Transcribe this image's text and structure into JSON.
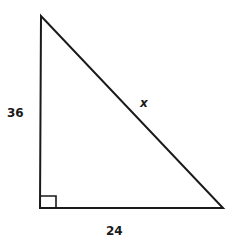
{
  "figure": {
    "type": "right-triangle",
    "labels": {
      "vertical_leg": "36",
      "horizontal_leg": "24",
      "hypotenuse": "x"
    },
    "right_angle_marker": true,
    "stroke_color": "#1a1a1a",
    "background": "#ffffff"
  }
}
